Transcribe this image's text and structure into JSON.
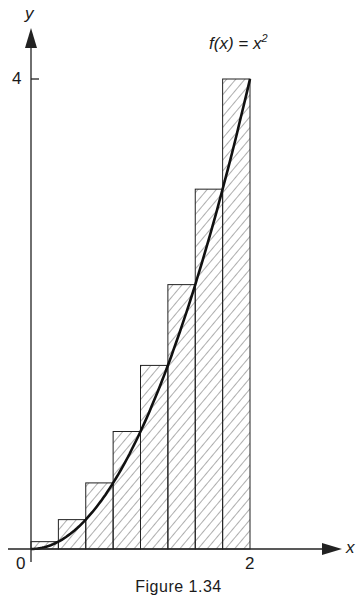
{
  "chart_data": {
    "type": "bar",
    "title": "Figure 1.34",
    "xlabel": "x",
    "ylabel": "y",
    "function_label": "f(x) = x²",
    "xlim": [
      0,
      2.3
    ],
    "ylim": [
      0,
      4.4
    ],
    "x_ticks": [
      {
        "value": 0,
        "label": "0"
      },
      {
        "value": 2,
        "label": "2"
      }
    ],
    "y_ticks": [
      {
        "value": 4,
        "label": "4"
      }
    ],
    "bar_width": 0.25,
    "categories": [
      "0–0.25",
      "0.25–0.5",
      "0.5–0.75",
      "0.75–1",
      "1–1.25",
      "1.25–1.5",
      "1.5–1.75",
      "1.75–2"
    ],
    "values": [
      0.0625,
      0.25,
      0.5625,
      1.0,
      1.5625,
      2.25,
      3.0625,
      4.0
    ],
    "bar_fill": "diagonal hatch",
    "curve": "y = x^2 from 0 to 2",
    "grid": false
  },
  "labels": {
    "y_axis": "y",
    "x_axis": "x",
    "y_tick_4": "4",
    "x_tick_0": "0",
    "x_tick_2": "2",
    "function": "f(x) = x",
    "function_exp": "2",
    "caption": "Figure 1.34"
  }
}
